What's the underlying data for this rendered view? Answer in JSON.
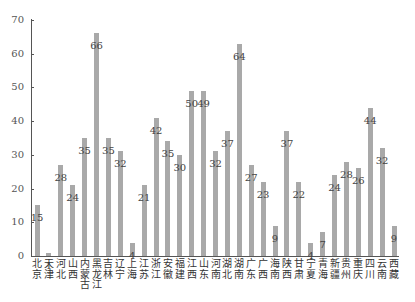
{
  "chart_data": {
    "type": "bar",
    "title": "",
    "xlabel": "",
    "ylabel": "",
    "ylim": [
      0,
      70
    ],
    "yticks": [
      0,
      10,
      20,
      30,
      40,
      50,
      60,
      70
    ],
    "grid": false,
    "legend": null,
    "bar_color": "#a9a9a9",
    "categories": [
      "北京",
      "天津",
      "河北",
      "山西",
      "内蒙古",
      "黑龙江",
      "吉林",
      "辽宁",
      "上海",
      "江苏",
      "浙江",
      "安徽",
      "福建",
      "江西",
      "山东",
      "河南",
      "湖北",
      "湖南",
      "广东",
      "广西",
      "海南",
      "陕西",
      "甘肃",
      "宁夏",
      "青海",
      "新疆",
      "贵州",
      "重庆",
      "四川",
      "云南",
      "西藏"
    ],
    "values": [
      15,
      1,
      27,
      21,
      35,
      66,
      35,
      31,
      4,
      21,
      41,
      34,
      30,
      49,
      49,
      31,
      37,
      63,
      27,
      22,
      9,
      37,
      22,
      4,
      7,
      24,
      28,
      26,
      44,
      32,
      9
    ],
    "data_labels": [
      "15",
      "1",
      "28",
      "24",
      "35",
      "66",
      "35",
      "32",
      "4",
      "21",
      "42",
      "35",
      "30",
      "50",
      "49",
      "32",
      "37",
      "64",
      "27",
      "23",
      "9",
      "37",
      "22",
      "4",
      "7",
      "24",
      "28",
      "26",
      "44",
      "32",
      "9"
    ]
  }
}
